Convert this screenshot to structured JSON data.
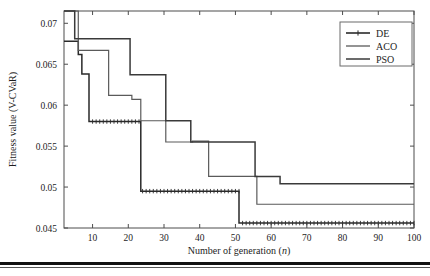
{
  "figure": {
    "background_color": "#ffffff",
    "frame_color": "#4d4d4d",
    "has_bottom_rule": true
  },
  "axes": {
    "x": {
      "label_prefix": "Number of generation (",
      "label_var": "n",
      "label_suffix": ")",
      "ticks": [
        "10",
        "20",
        "30",
        "40",
        "50",
        "60",
        "70",
        "80",
        "90",
        "100"
      ],
      "tick_values": [
        10,
        20,
        30,
        40,
        50,
        60,
        70,
        80,
        90,
        100
      ],
      "range": [
        2,
        100
      ],
      "minor_ticks": true
    },
    "y": {
      "label": "Fitness value (V-CVaR)",
      "ticks": [
        "0.045",
        "0.05",
        "0.055",
        "0.06",
        "0.065",
        "0.07"
      ],
      "tick_values": [
        0.045,
        0.05,
        0.055,
        0.06,
        0.065,
        0.07
      ],
      "range": [
        0.045,
        0.0715
      ]
    }
  },
  "legend": {
    "position": "top-right",
    "entries": [
      {
        "label": "DE",
        "color": "#2a2a2a",
        "line_width": 1.6,
        "marker": "cross"
      },
      {
        "label": "ACO",
        "color": "#5a5a5a",
        "line_width": 1.3,
        "marker": "none"
      },
      {
        "label": "PSO",
        "color": "#3a3a3a",
        "line_width": 1.5,
        "marker": "none"
      }
    ]
  },
  "chart_data": {
    "type": "line",
    "subtype": "step-post",
    "title": "",
    "xlabel": "Number of generation (n)",
    "ylabel": "Fitness value (V-CVaR)",
    "xlim": [
      2,
      100
    ],
    "ylim": [
      0.045,
      0.0715
    ],
    "grid": false,
    "legend_position": "top-right",
    "series": [
      {
        "name": "DE",
        "color": "#2a2a2a",
        "step_points": [
          [
            2,
            0.0678
          ],
          [
            6,
            0.0678
          ],
          [
            6,
            0.0662
          ],
          [
            7,
            0.0662
          ],
          [
            7,
            0.0638
          ],
          [
            9,
            0.0638
          ],
          [
            9,
            0.058
          ],
          [
            23.5,
            0.058
          ],
          [
            23.5,
            0.0495
          ],
          [
            51,
            0.0495
          ],
          [
            51,
            0.0456
          ],
          [
            100,
            0.0456
          ]
        ],
        "final_value": 0.0456
      },
      {
        "name": "ACO",
        "color": "#5a5a5a",
        "step_points": [
          [
            2,
            0.0715
          ],
          [
            6,
            0.0715
          ],
          [
            6,
            0.0667
          ],
          [
            14.5,
            0.0667
          ],
          [
            14.5,
            0.0612
          ],
          [
            21,
            0.0612
          ],
          [
            21,
            0.0607
          ],
          [
            23.5,
            0.0607
          ],
          [
            23.5,
            0.0581
          ],
          [
            30.5,
            0.0581
          ],
          [
            30.5,
            0.0555
          ],
          [
            38,
            0.0555
          ],
          [
            38,
            0.0556
          ],
          [
            42.5,
            0.0556
          ],
          [
            42.5,
            0.0513
          ],
          [
            56,
            0.0513
          ],
          [
            56,
            0.0479
          ],
          [
            100,
            0.0479
          ]
        ],
        "final_value": 0.0479
      },
      {
        "name": "PSO",
        "color": "#3a3a3a",
        "step_points": [
          [
            2,
            0.0715
          ],
          [
            5,
            0.0715
          ],
          [
            5,
            0.0681
          ],
          [
            20.5,
            0.0681
          ],
          [
            20.5,
            0.0637
          ],
          [
            30.5,
            0.0637
          ],
          [
            30.5,
            0.0581
          ],
          [
            37.5,
            0.0581
          ],
          [
            37.5,
            0.0555
          ],
          [
            55.5,
            0.0555
          ],
          [
            55.5,
            0.0513
          ],
          [
            62.5,
            0.0513
          ],
          [
            62.5,
            0.0504
          ],
          [
            100,
            0.0504
          ]
        ],
        "final_value": 0.0504
      }
    ]
  }
}
